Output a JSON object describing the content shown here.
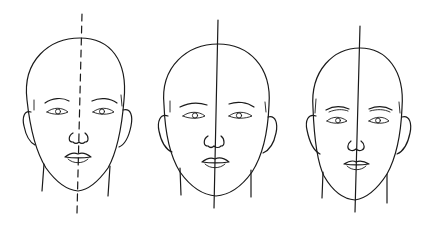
{
  "figure": {
    "line_color": "#1a1a1a",
    "background": "#ffffff",
    "faces": [
      {
        "id": "face-1",
        "axis_style": "dashed",
        "label": "Face with dashed center line"
      },
      {
        "id": "face-2",
        "axis_style": "solid",
        "label": "Face with solid center line"
      },
      {
        "id": "face-3",
        "axis_style": "solid",
        "label": "Face with solid slightly tilted center line"
      }
    ]
  }
}
